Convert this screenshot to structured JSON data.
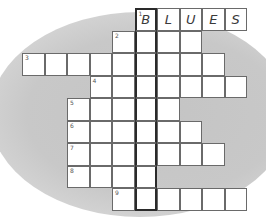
{
  "puzzle": {
    "type": "crossword",
    "highlight_column": 5,
    "cell_size": 22.5,
    "origin": {
      "x": 22,
      "y": 8
    },
    "rows": [
      {
        "clue": "1",
        "row": 0,
        "start_col": 5,
        "length": 5,
        "letters": [
          "B",
          "L",
          "U",
          "E",
          "S"
        ]
      },
      {
        "clue": "2",
        "row": 1,
        "start_col": 4,
        "length": 4,
        "letters": [
          "",
          "",
          "",
          ""
        ]
      },
      {
        "clue": "3",
        "row": 2,
        "start_col": 0,
        "length": 9,
        "letters": [
          "",
          "",
          "",
          "",
          "",
          "",
          "",
          "",
          ""
        ]
      },
      {
        "clue": "4",
        "row": 3,
        "start_col": 3,
        "length": 7,
        "letters": [
          "",
          "",
          "",
          "",
          "",
          "",
          ""
        ]
      },
      {
        "clue": "5",
        "row": 4,
        "start_col": 2,
        "length": 5,
        "letters": [
          "",
          "",
          "",
          "",
          ""
        ]
      },
      {
        "clue": "6",
        "row": 5,
        "start_col": 2,
        "length": 6,
        "letters": [
          "",
          "",
          "",
          "",
          "",
          ""
        ]
      },
      {
        "clue": "7",
        "row": 6,
        "start_col": 2,
        "length": 7,
        "letters": [
          "",
          "",
          "",
          "",
          "",
          "",
          ""
        ]
      },
      {
        "clue": "8",
        "row": 7,
        "start_col": 2,
        "length": 4,
        "letters": [
          "",
          "",
          "",
          ""
        ]
      },
      {
        "clue": "9",
        "row": 8,
        "start_col": 4,
        "length": 6,
        "letters": [
          "",
          "",
          "",
          "",
          "",
          ""
        ]
      }
    ]
  },
  "colors": {
    "background": "#ffffff",
    "blob": "#c8c8c8",
    "cell": "#ffffff",
    "border": "#6a6a6a",
    "highlight_border": "#2a2a2a",
    "text": "#3a3a3a"
  }
}
